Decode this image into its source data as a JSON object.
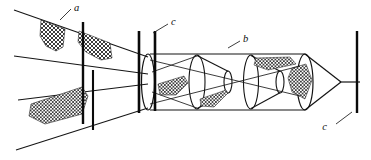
{
  "figure": {
    "kind": "line-diagram",
    "width": 371,
    "height": 160,
    "background_color": "#ffffff",
    "ink_color": "#121212",
    "mesh_color": "#2b2b2b"
  },
  "labels": {
    "a": "a",
    "b": "b",
    "c_upper": "c",
    "c_lower": "c"
  },
  "parts": {
    "leader_wings": "a",
    "net_body": "b",
    "stakes": "c"
  },
  "structure": {
    "stake_count": 5,
    "funnel_count": 3,
    "mesh_panel_count": 7,
    "leader_line_count": 4
  }
}
